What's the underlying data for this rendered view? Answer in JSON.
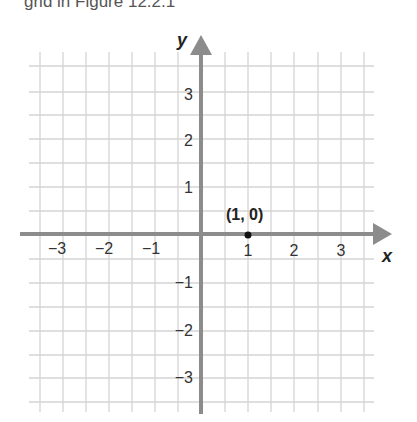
{
  "caption": "grid in Figure 12.2.1",
  "graph": {
    "x_axis_label": "x",
    "y_axis_label": "y",
    "x_ticks": [
      "−3",
      "−2",
      "−1",
      "1",
      "2",
      "3"
    ],
    "y_ticks": [
      "3",
      "2",
      "1",
      "−1",
      "−2",
      "−3"
    ],
    "point": {
      "label": "(1, 0)",
      "x": 1,
      "y": 0
    },
    "colors": {
      "axis": "#8c8c8c",
      "grid": "#d4d4d4",
      "text": "#222222"
    }
  }
}
